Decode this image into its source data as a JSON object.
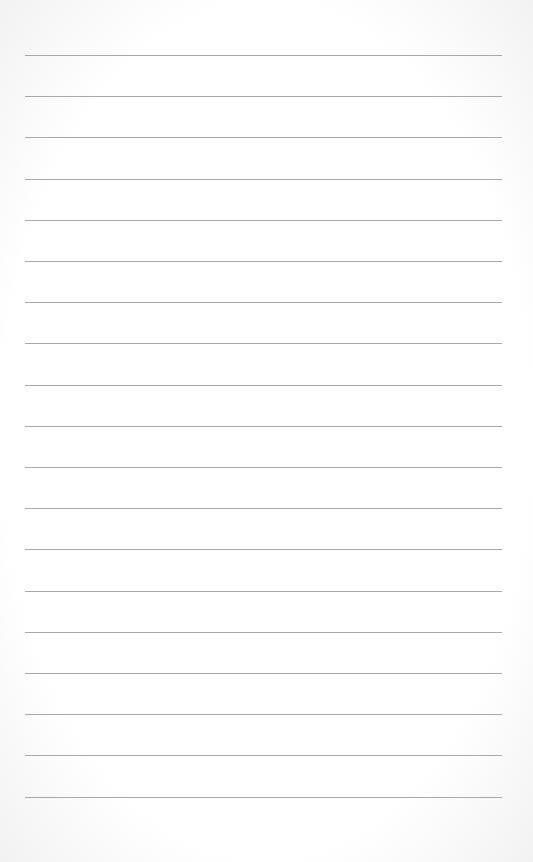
{
  "page": {
    "type": "lined-paper",
    "background_color": "#ffffff",
    "line_color": "#9a9a9a",
    "line_count": 19,
    "first_line_y": 55,
    "line_spacing": 41.2,
    "line_left": 25,
    "line_right": 502,
    "text": ""
  }
}
